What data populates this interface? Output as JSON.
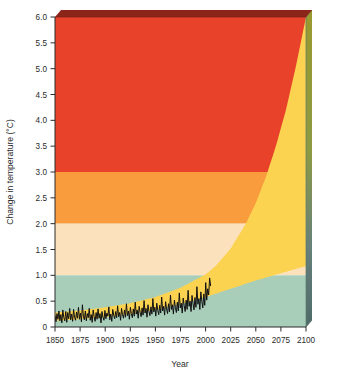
{
  "chart_data": {
    "type": "area",
    "title": "",
    "subtitle": "",
    "xlabel": "Year",
    "ylabel": "Change in temperature (°C)",
    "xlim": [
      1850,
      2100
    ],
    "ylim": [
      0,
      6
    ],
    "grid": false,
    "legend_position": "none",
    "x_ticks": [
      1850,
      1875,
      1900,
      1925,
      1950,
      1975,
      2000,
      2025,
      2050,
      2075,
      2100
    ],
    "x_tick_labels": [
      "1850",
      "1875",
      "1900",
      "1925",
      "1950",
      "1975",
      "2000",
      "2025",
      "2050",
      "2075",
      "2100"
    ],
    "y_ticks": [
      0,
      0.5,
      1.0,
      1.5,
      2.0,
      2.5,
      3.0,
      3.5,
      4.0,
      4.5,
      5.0,
      5.5,
      6.0
    ],
    "y_tick_labels": [
      "0",
      "0.5",
      "1.0",
      "1.5",
      "2.0",
      "2.5",
      "3.0",
      "3.5",
      "4.0",
      "4.5",
      "5.0",
      "5.5",
      "6.0"
    ],
    "background_bands": [
      {
        "name": "low-risk-band",
        "from": 0.0,
        "to": 1.0,
        "color": "#a8ceba"
      },
      {
        "name": "moderate-risk-band",
        "from": 1.0,
        "to": 2.0,
        "color": "#fbe2bd"
      },
      {
        "name": "high-risk-band",
        "from": 2.0,
        "to": 3.0,
        "color": "#f89c3e"
      },
      {
        "name": "very-high-risk-band",
        "from": 3.0,
        "to": 6.0,
        "color": "#e8422a"
      }
    ],
    "projection_wedge": {
      "name": "projected-warming-range",
      "color": "#fbd351",
      "upper_bound": {
        "x": [
          1850,
          1875,
          1900,
          1925,
          1950,
          1975,
          2000,
          2010,
          2025,
          2040,
          2050,
          2060,
          2070,
          2080,
          2090,
          2100
        ],
        "y": [
          0.28,
          0.32,
          0.38,
          0.46,
          0.58,
          0.76,
          1.02,
          1.18,
          1.52,
          2.0,
          2.4,
          2.9,
          3.5,
          4.2,
          5.05,
          6.0
        ]
      },
      "lower_bound": {
        "x": [
          1850,
          1875,
          1900,
          1925,
          1950,
          1975,
          2000,
          2025,
          2050,
          2075,
          2100
        ],
        "y": [
          0.12,
          0.15,
          0.19,
          0.25,
          0.33,
          0.44,
          0.58,
          0.74,
          0.9,
          1.04,
          1.18
        ]
      }
    },
    "series": [
      {
        "name": "observed-global-temperature",
        "type": "line",
        "color": "#111111",
        "x_start": 1850,
        "x_end": 2005,
        "values": [
          0.22,
          0.1,
          0.26,
          0.15,
          0.31,
          0.12,
          0.24,
          0.08,
          0.33,
          0.18,
          0.12,
          0.3,
          0.09,
          0.28,
          0.16,
          0.36,
          0.14,
          0.25,
          0.11,
          0.34,
          0.19,
          0.13,
          0.29,
          0.17,
          0.38,
          0.15,
          0.27,
          0.1,
          0.43,
          0.21,
          0.14,
          0.31,
          0.12,
          0.26,
          0.18,
          0.36,
          0.13,
          0.24,
          0.09,
          0.33,
          0.2,
          0.11,
          0.28,
          0.15,
          0.35,
          0.17,
          0.26,
          0.08,
          0.3,
          0.19,
          0.13,
          0.32,
          0.16,
          0.27,
          0.21,
          0.39,
          0.14,
          0.25,
          0.11,
          0.34,
          0.23,
          0.16,
          0.3,
          0.18,
          0.41,
          0.2,
          0.28,
          0.13,
          0.36,
          0.24,
          0.17,
          0.33,
          0.19,
          0.45,
          0.22,
          0.31,
          0.15,
          0.38,
          0.26,
          0.18,
          0.35,
          0.21,
          0.48,
          0.25,
          0.33,
          0.17,
          0.4,
          0.28,
          0.2,
          0.37,
          0.23,
          0.51,
          0.27,
          0.36,
          0.19,
          0.43,
          0.3,
          0.22,
          0.39,
          0.25,
          0.55,
          0.29,
          0.38,
          0.21,
          0.46,
          0.32,
          0.24,
          0.42,
          0.27,
          0.58,
          0.31,
          0.4,
          0.23,
          0.49,
          0.35,
          0.26,
          0.45,
          0.29,
          0.62,
          0.34,
          0.43,
          0.25,
          0.52,
          0.38,
          0.28,
          0.48,
          0.31,
          0.66,
          0.37,
          0.46,
          0.27,
          0.56,
          0.41,
          0.3,
          0.52,
          0.34,
          0.71,
          0.4,
          0.5,
          0.3,
          0.61,
          0.45,
          0.33,
          0.57,
          0.38,
          0.78,
          0.44,
          0.55,
          0.34,
          0.68,
          0.5,
          0.37,
          0.64,
          0.42,
          0.86,
          0.52,
          0.74,
          0.62,
          0.95,
          0.8
        ]
      }
    ],
    "annotations": []
  },
  "axes": {
    "x_axis_label": "Year",
    "y_axis_label": "Change in temperature (°C)"
  },
  "style": {
    "plot_top_bevel_color": "#8c2519",
    "plot_side_panel_top_color": "#9a9a2e",
    "plot_side_panel_bottom_color": "#4f6b68",
    "axis_line_color": "#2b2b2b",
    "figure_background": "#ffffff"
  }
}
